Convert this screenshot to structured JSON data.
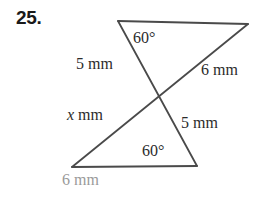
{
  "problem": {
    "number": "25."
  },
  "figure": {
    "type": "two-intersecting-triangles",
    "stroke_color": "#4a4a4a",
    "labels": {
      "angle_top": "60°",
      "side_left_upper": "5 mm",
      "side_right_upper": "6 mm",
      "side_left_lower_prefix": "x",
      "side_left_lower_suffix": " mm",
      "side_right_lower": "5 mm",
      "angle_bottom": "60°",
      "base_bottom": "6 mm"
    },
    "label_colors": {
      "default": "#2b2b2b",
      "base_bottom": "#9a9a9a"
    },
    "vertices": {
      "top_left": [
        118,
        21
      ],
      "top_right": [
        248,
        24
      ],
      "crossing": [
        157,
        97
      ],
      "bottom_left": [
        72,
        167
      ],
      "bottom_right": [
        197,
        166
      ]
    },
    "segments": [
      {
        "name": "top-edge",
        "from": "top_left",
        "to": "top_right"
      },
      {
        "name": "left-diagonal",
        "from": "top_left",
        "to": "bottom_right"
      },
      {
        "name": "right-diagonal",
        "from": "top_right",
        "to": "bottom_left"
      },
      {
        "name": "bottom-edge",
        "from": "bottom_left",
        "to": "bottom_right"
      }
    ]
  }
}
